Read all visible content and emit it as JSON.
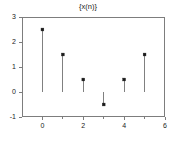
{
  "chart_data": {
    "type": "bar",
    "plot_style": "stem",
    "title": "{x(n)}",
    "xlabel": "",
    "ylabel": "",
    "categories": [
      "0",
      "1",
      "2",
      "3",
      "4",
      "5"
    ],
    "x": [
      0,
      1,
      2,
      3,
      4,
      5
    ],
    "values": [
      2.5,
      1.5,
      0.5,
      -0.5,
      0.5,
      1.5
    ],
    "xlim": [
      -1,
      6
    ],
    "ylim": [
      -1,
      3
    ],
    "xticks": [
      0,
      2,
      4,
      6
    ],
    "xtick_labels": [
      "0",
      "2",
      "4",
      "6"
    ],
    "xminorticks": [
      1,
      3,
      5
    ],
    "yticks": [
      -1,
      0,
      1,
      2,
      3
    ],
    "ytick_labels": [
      "-1",
      "0",
      "1",
      "2",
      "3"
    ],
    "grid": false,
    "legend": null,
    "baseline": 0,
    "marker": "square",
    "colors": {
      "stem": "#808080",
      "marker": "#1a1a1a",
      "axis": "#7d7d7d",
      "text": "#222222",
      "background": "#ffffff"
    }
  }
}
